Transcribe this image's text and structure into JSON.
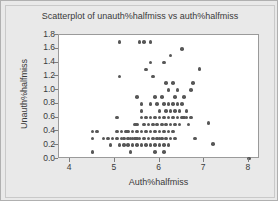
{
  "chart_data": {
    "type": "scatter",
    "title": "Scatterplot of unauth%halfmiss vs auth%halfmiss",
    "xlabel": "Auth%halfmiss",
    "ylabel": "Unauth%halfmiss",
    "xlim": [
      3.75,
      8.25
    ],
    "ylim": [
      0.0,
      1.8
    ],
    "xticks": [
      4,
      5,
      6,
      7,
      8
    ],
    "xtick_labels": [
      "4",
      "5",
      "6",
      "7",
      "8"
    ],
    "yticks": [
      0.0,
      0.2,
      0.4,
      0.6,
      0.8,
      1.0,
      1.2,
      1.4,
      1.6,
      1.8
    ],
    "ytick_labels": [
      "0.0",
      "0.2",
      "0.4",
      "0.6",
      "0.8",
      "1.0",
      "1.2",
      "1.4",
      "1.6",
      "1.8"
    ],
    "grid": false,
    "legend": null,
    "marker_color": "#575757",
    "plot_background": "#ffffff",
    "figure_background": "#e9e9e9",
    "points": [
      [
        4.5,
        0.1
      ],
      [
        4.5,
        0.3
      ],
      [
        4.5,
        0.4
      ],
      [
        4.6,
        0.4
      ],
      [
        4.75,
        0.3
      ],
      [
        4.85,
        0.3
      ],
      [
        4.9,
        0.2
      ],
      [
        4.95,
        0.3
      ],
      [
        5.05,
        0.3
      ],
      [
        5.05,
        0.4
      ],
      [
        5.05,
        0.6
      ],
      [
        5.1,
        1.7
      ],
      [
        5.1,
        1.2
      ],
      [
        5.1,
        0.2
      ],
      [
        5.15,
        0.3
      ],
      [
        5.15,
        0.4
      ],
      [
        5.2,
        0.2
      ],
      [
        5.2,
        0.3
      ],
      [
        5.25,
        0.4
      ],
      [
        5.3,
        0.2
      ],
      [
        5.3,
        0.3
      ],
      [
        5.3,
        0.4
      ],
      [
        5.35,
        0.1
      ],
      [
        5.35,
        0.3
      ],
      [
        5.4,
        0.2
      ],
      [
        5.4,
        0.3
      ],
      [
        5.4,
        0.4
      ],
      [
        5.45,
        0.3
      ],
      [
        5.45,
        0.5
      ],
      [
        5.5,
        0.2
      ],
      [
        5.5,
        0.3
      ],
      [
        5.5,
        0.4
      ],
      [
        5.5,
        0.5
      ],
      [
        5.5,
        0.9
      ],
      [
        5.55,
        1.7
      ],
      [
        5.55,
        0.3
      ],
      [
        5.6,
        0.2
      ],
      [
        5.6,
        0.4
      ],
      [
        5.6,
        0.6
      ],
      [
        5.6,
        0.7
      ],
      [
        5.6,
        0.8
      ],
      [
        5.65,
        1.7
      ],
      [
        5.65,
        0.3
      ],
      [
        5.65,
        0.5
      ],
      [
        5.7,
        0.2
      ],
      [
        5.7,
        0.4
      ],
      [
        5.7,
        0.6
      ],
      [
        5.7,
        1.3
      ],
      [
        5.75,
        0.3
      ],
      [
        5.75,
        0.5
      ],
      [
        5.8,
        1.7
      ],
      [
        5.8,
        0.2
      ],
      [
        5.8,
        0.4
      ],
      [
        5.8,
        0.6
      ],
      [
        5.8,
        0.8
      ],
      [
        5.8,
        1.4
      ],
      [
        5.85,
        0.3
      ],
      [
        5.85,
        0.5
      ],
      [
        5.85,
        1.2
      ],
      [
        5.9,
        0.1
      ],
      [
        5.9,
        0.2
      ],
      [
        5.9,
        0.4
      ],
      [
        5.9,
        0.6
      ],
      [
        5.9,
        0.9
      ],
      [
        5.95,
        0.3
      ],
      [
        5.95,
        0.5
      ],
      [
        5.95,
        0.8
      ],
      [
        6.0,
        0.2
      ],
      [
        6.0,
        0.3
      ],
      [
        6.0,
        0.4
      ],
      [
        6.0,
        0.6
      ],
      [
        6.0,
        0.7
      ],
      [
        6.05,
        0.3
      ],
      [
        6.05,
        0.5
      ],
      [
        6.05,
        0.9
      ],
      [
        6.1,
        0.1
      ],
      [
        6.1,
        0.2
      ],
      [
        6.1,
        0.4
      ],
      [
        6.1,
        0.6
      ],
      [
        6.1,
        0.8
      ],
      [
        6.1,
        1.4
      ],
      [
        6.15,
        0.3
      ],
      [
        6.15,
        0.5
      ],
      [
        6.15,
        0.7
      ],
      [
        6.15,
        1.1
      ],
      [
        6.2,
        0.2
      ],
      [
        6.2,
        0.4
      ],
      [
        6.2,
        0.6
      ],
      [
        6.2,
        0.8
      ],
      [
        6.2,
        1.0
      ],
      [
        6.25,
        0.3
      ],
      [
        6.25,
        0.5
      ],
      [
        6.25,
        0.7
      ],
      [
        6.25,
        1.5
      ],
      [
        6.3,
        0.4
      ],
      [
        6.3,
        0.6
      ],
      [
        6.3,
        0.8
      ],
      [
        6.3,
        1.1
      ],
      [
        6.35,
        0.3
      ],
      [
        6.35,
        0.5
      ],
      [
        6.35,
        0.7
      ],
      [
        6.35,
        0.9
      ],
      [
        6.4,
        0.6
      ],
      [
        6.4,
        0.8
      ],
      [
        6.4,
        1.0
      ],
      [
        6.45,
        0.5
      ],
      [
        6.45,
        0.7
      ],
      [
        6.5,
        0.6
      ],
      [
        6.5,
        0.8
      ],
      [
        6.5,
        1.6
      ],
      [
        6.55,
        0.6
      ],
      [
        6.55,
        0.9
      ],
      [
        6.6,
        0.6
      ],
      [
        6.6,
        0.7
      ],
      [
        6.65,
        0.5
      ],
      [
        6.7,
        0.6
      ],
      [
        6.7,
        1.0
      ],
      [
        6.75,
        1.1
      ],
      [
        6.8,
        0.3
      ],
      [
        6.9,
        1.31
      ],
      [
        7.1,
        0.52
      ],
      [
        7.2,
        0.22
      ],
      [
        8.0,
        0.01
      ]
    ]
  }
}
